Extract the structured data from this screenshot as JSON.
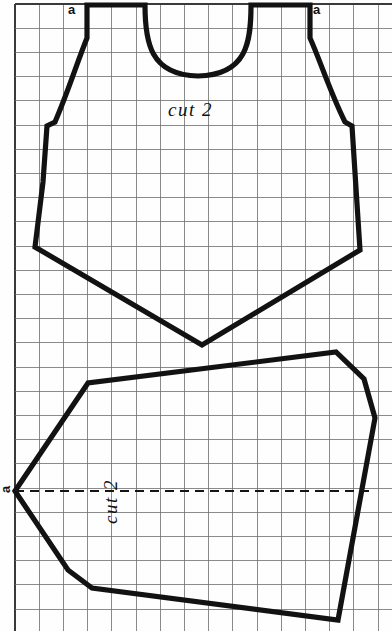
{
  "sheet": {
    "title": "Sewing pattern sheet on graph paper",
    "width": 392,
    "height": 631,
    "background_color": "#fefefe",
    "grid": {
      "cell_size": 24.2,
      "origin_x": 15,
      "origin_y": 4,
      "line_color": "#6d6d6d",
      "line_width": 0.8,
      "border_color": "#3a3a3a",
      "border_width": 1.2,
      "visible": true,
      "columns": 16,
      "rows": 26
    },
    "ink_color": "#121212",
    "pattern_line_width": 5.2
  },
  "pieces": [
    {
      "id": "bodice",
      "name": "top-bodice-piece",
      "cut_label": "cut 2",
      "label_x": 168,
      "label_y": 100,
      "notches": [
        {
          "label": "a",
          "x": 68,
          "y": 3
        },
        {
          "label": "a",
          "x": 313,
          "y": 3
        }
      ],
      "outline": "M 87 5 L 145 5 C 145 42, 150 75, 198 76 C 247 75, 251 42, 251 5 L 310 5 L 310 38 C 320 60, 330 92, 345 122 L 352 126 L 360 250 L 202 345 L 35 247 L 43 182 L 47 126 L 55 122 C 68 92, 78 60, 87 38 Z"
    },
    {
      "id": "lower",
      "name": "bottom-panel-piece",
      "cut_label": "cut 2",
      "label_x": 88,
      "label_y": 492,
      "notches": [
        {
          "label": "a",
          "x": 2,
          "y": 483
        }
      ],
      "outline": "M 15 491 L 88 383 L 336 352 L 364 379 L 375 418 L 338 620 L 92 588 L 68 570 Z",
      "grainline": {
        "name": "grainline-dashed",
        "x1": 15,
        "y1": 491,
        "x2": 375,
        "y2": 491,
        "style": "dashed",
        "color": "#151515"
      }
    }
  ]
}
